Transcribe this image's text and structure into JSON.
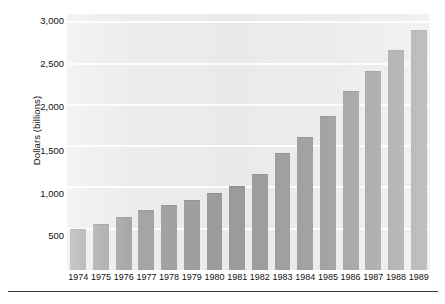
{
  "chart_data": {
    "type": "bar",
    "title": "",
    "xlabel": "",
    "ylabel": "Dollars (billions)",
    "categories": [
      "1974",
      "1975",
      "1976",
      "1977",
      "1978",
      "1979",
      "1980",
      "1981",
      "1982",
      "1983",
      "1984",
      "1985",
      "1986",
      "1987",
      "1988",
      "1989"
    ],
    "values": [
      490,
      545,
      630,
      710,
      780,
      840,
      925,
      1005,
      1150,
      1400,
      1600,
      1850,
      2150,
      2400,
      2650,
      2900
    ],
    "ylim": [
      0,
      3100
    ],
    "y_ticks": [
      500,
      1000,
      1500,
      2000,
      2500,
      3000
    ],
    "y_tick_labels": [
      "500",
      "1,000",
      "1,500",
      "2,000",
      "2,500",
      "3,000"
    ],
    "grid": true,
    "grid_color": "#fdfdfd",
    "legend": null,
    "bar_color": "#9a9a9a",
    "plot_background": "#eaeaea"
  },
  "axes": {
    "y_title": "Dollars (billions)",
    "y_labels": [
      "3,000",
      "2,500",
      "2,000",
      "1,500",
      "1,000",
      "500"
    ],
    "x_labels": [
      "1974",
      "1975",
      "1976",
      "1977",
      "1978",
      "1979",
      "1980",
      "1981",
      "1982",
      "1983",
      "1984",
      "1985",
      "1986",
      "1987",
      "1988",
      "1989"
    ]
  }
}
